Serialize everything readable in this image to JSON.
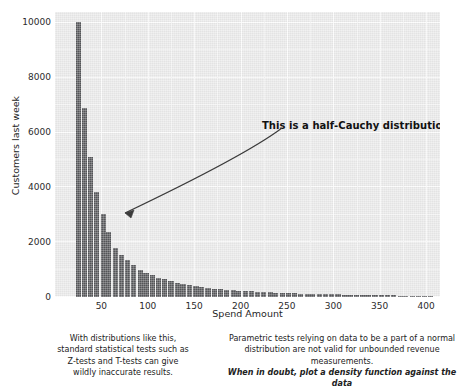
{
  "chart_data": {
    "type": "bar",
    "title": "",
    "subtitle": "",
    "xlabel": "Spend Amount",
    "ylabel": "Customers last week",
    "xlim": [
      0,
      415
    ],
    "ylim": [
      0,
      10400
    ],
    "xticks": [
      50,
      100,
      150,
      200,
      250,
      300,
      350,
      400
    ],
    "yticks": [
      0,
      2000,
      4000,
      6000,
      8000,
      10000
    ],
    "grid": true,
    "legend": null,
    "bar_color": "#555659",
    "panel_color": "#e9e9e9",
    "gridline_color": "#fbfbfb",
    "annotations": [
      {
        "text": "This is a half-Cauchy distribution.",
        "x": 175,
        "y": 8750,
        "arrow_to_x": 68,
        "arrow_to_y": 3180,
        "bold": true
      }
    ],
    "x": [
      25,
      32,
      38,
      45,
      52,
      58,
      65,
      72,
      78,
      85,
      92,
      98,
      105,
      112,
      118,
      125,
      132,
      138,
      145,
      152,
      158,
      165,
      172,
      178,
      185,
      192,
      198,
      205,
      212,
      218,
      225,
      232,
      238,
      245,
      252,
      258,
      265,
      272,
      278,
      285,
      292,
      298,
      305,
      312,
      318,
      325,
      332,
      338,
      345,
      352,
      358,
      365,
      372,
      378,
      385,
      392,
      398,
      405
    ],
    "values": [
      10050,
      6900,
      5120,
      3820,
      3020,
      2380,
      1800,
      1520,
      1340,
      1160,
      1000,
      880,
      790,
      700,
      640,
      580,
      520,
      480,
      440,
      400,
      370,
      340,
      310,
      290,
      270,
      250,
      235,
      220,
      205,
      195,
      182,
      172,
      162,
      152,
      145,
      136,
      128,
      122,
      115,
      109,
      103,
      98,
      92,
      88,
      83,
      79,
      75,
      71,
      67,
      64,
      60,
      57,
      54,
      51,
      48,
      45,
      42,
      38
    ]
  },
  "captions": {
    "left": [
      "With distributions like this,",
      "standard statistical tests such as",
      "Z-tests and T-tests can give",
      "wildly inaccurate results."
    ],
    "right": [
      "Parametric tests relying on data to be a part of a normal",
      "distribution are not valid for unbounded revenue",
      "measurements."
    ],
    "right_emphasis": "When in doubt, plot a density function against the data"
  }
}
